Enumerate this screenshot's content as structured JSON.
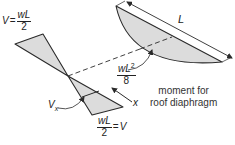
{
  "diagram": {
    "colors": {
      "fill": "#dcdcdc",
      "stroke": "#2a2a2a",
      "text": "#222222"
    },
    "labels": {
      "shear_top": {
        "lhs": "V",
        "eq": "=",
        "num": "wL",
        "den": "2"
      },
      "shear_bottom": {
        "num": "wL",
        "den": "2",
        "eq": "=",
        "rhs": "V"
      },
      "vx": {
        "main": "V",
        "sub": "x"
      },
      "x_axis": "x",
      "span": "L",
      "moment_max": {
        "num": "wL",
        "sup": "2",
        "den": "8"
      },
      "caption_line1": "moment for",
      "caption_line2": "roof diaphragm"
    }
  }
}
